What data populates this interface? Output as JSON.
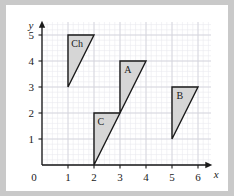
{
  "chart_data": {
    "type": "scatter",
    "title": "",
    "xlabel": "x",
    "ylabel": "y",
    "xlim": [
      0,
      6.6
    ],
    "ylim": [
      0,
      5.6
    ],
    "grid": true,
    "grid_minor_step": 0.2,
    "grid_major_step": 1,
    "legend": "none",
    "x_ticks": [
      "0",
      "1",
      "2",
      "3",
      "4",
      "5",
      "6"
    ],
    "x_tick_values": [
      0,
      1,
      2,
      3,
      4,
      5,
      6
    ],
    "y_ticks": [
      "0",
      "1",
      "2",
      "3",
      "4",
      "5"
    ],
    "y_tick_values": [
      0,
      1,
      2,
      3,
      4,
      5
    ],
    "origin_label": "0",
    "shapes": [
      {
        "label": "Ch",
        "type": "triangle",
        "vertices": [
          [
            1,
            5
          ],
          [
            2,
            5
          ],
          [
            1,
            3
          ]
        ],
        "label_at": [
          1.35,
          4.55
        ],
        "fill": "#d6d6d6",
        "stroke": "#1a1a1a"
      },
      {
        "label": "A",
        "type": "triangle",
        "vertices": [
          [
            3,
            4
          ],
          [
            4,
            4
          ],
          [
            3,
            2
          ]
        ],
        "label_at": [
          3.3,
          3.55
        ],
        "fill": "#d6d6d6",
        "stroke": "#1a1a1a"
      },
      {
        "label": "B",
        "type": "triangle",
        "vertices": [
          [
            5,
            3
          ],
          [
            6,
            3
          ],
          [
            5,
            1
          ]
        ],
        "label_at": [
          5.3,
          2.55
        ],
        "fill": "#d6d6d6",
        "stroke": "#1a1a1a"
      },
      {
        "label": "C",
        "type": "triangle",
        "vertices": [
          [
            2,
            2
          ],
          [
            3,
            2
          ],
          [
            2,
            0
          ]
        ],
        "label_at": [
          2.26,
          1.55
        ],
        "fill": "#d6d6d6",
        "stroke": "#1a1a1a"
      }
    ]
  },
  "colors": {
    "background": "#ffffff",
    "frame": "#c9c9c9",
    "axis": "#1a1a1a",
    "grid_minor": "#e9e9ee",
    "grid_major": "#d4d4dc",
    "shape_fill": "#d6d6d6",
    "shape_stroke": "#1a1a1a"
  }
}
